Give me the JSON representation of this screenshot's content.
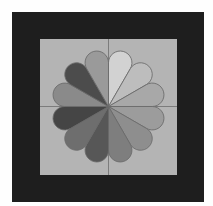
{
  "figure": {
    "background_color": "#fefefe",
    "frame_color": "#1e1e1e",
    "inner_square_color": "#b4b4b4",
    "axis_line_color": "#7c7c7c",
    "petal_outline_color": "#6a6a6a",
    "center": {
      "x": 108.5,
      "y": 106.5
    },
    "outer_radius": 57,
    "petal_count": 12,
    "petals": [
      {
        "index": 0,
        "angle_start": 0,
        "angle_end": 30,
        "color": "#d2d2d2"
      },
      {
        "index": 1,
        "angle_start": 30,
        "angle_end": 60,
        "color": "#bdbdbd"
      },
      {
        "index": 2,
        "angle_start": 60,
        "angle_end": 90,
        "color": "#a8a8a8"
      },
      {
        "index": 3,
        "angle_start": 90,
        "angle_end": 120,
        "color": "#9c9c9c"
      },
      {
        "index": 4,
        "angle_start": 120,
        "angle_end": 150,
        "color": "#8e8e8e"
      },
      {
        "index": 5,
        "angle_start": 150,
        "angle_end": 180,
        "color": "#7e7e7e"
      },
      {
        "index": 6,
        "angle_start": 180,
        "angle_end": 210,
        "color": "#575757"
      },
      {
        "index": 7,
        "angle_start": 210,
        "angle_end": 240,
        "color": "#6e6e6e"
      },
      {
        "index": 8,
        "angle_start": 240,
        "angle_end": 270,
        "color": "#454545"
      },
      {
        "index": 9,
        "angle_start": 270,
        "angle_end": 300,
        "color": "#8a8a8a"
      },
      {
        "index": 10,
        "angle_start": 300,
        "angle_end": 330,
        "color": "#4c4c4c"
      },
      {
        "index": 11,
        "angle_start": 330,
        "angle_end": 360,
        "color": "#9a9a9a"
      }
    ]
  }
}
